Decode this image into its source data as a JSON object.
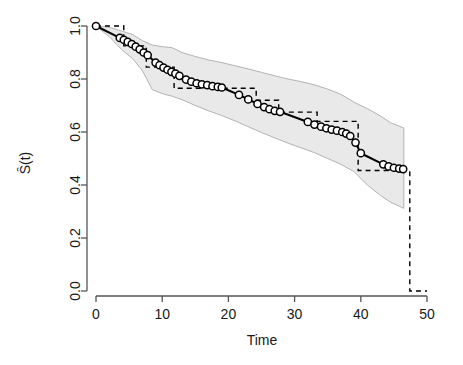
{
  "chart_data": {
    "type": "line",
    "title": "",
    "subtitle": "",
    "xlabel": "Time",
    "ylabel": "Ŝ(t)",
    "xlim": [
      -1.5,
      52
    ],
    "ylim": [
      -0.03,
      1.03
    ],
    "xticks": [
      0,
      10,
      20,
      30,
      40,
      50
    ],
    "xtick_labels": [
      "0",
      "10",
      "20",
      "30",
      "40",
      "50"
    ],
    "yticks": [
      0.0,
      0.2,
      0.4,
      0.6,
      0.8,
      1.0
    ],
    "ytick_labels": [
      "0.0",
      "0.2",
      "0.4",
      "0.6",
      "0.8",
      "1.0"
    ],
    "grid": false,
    "legend": null,
    "legend_position": "none",
    "colors": {
      "band_fill": "#e9e9e9",
      "band_stroke": "#b3b3b3",
      "smooth_line": "#000000",
      "step_line": "#000000",
      "axis": "#555555",
      "marker_face": "#ffffff",
      "marker_edge": "#000000"
    },
    "series": [
      {
        "name": "smooth-survival-estimate",
        "style": "solid-line-with-open-circles",
        "x": [
          0.0,
          3.6,
          4.2,
          4.8,
          5.4,
          6.0,
          6.6,
          7.2,
          7.8,
          9.0,
          9.6,
          10.2,
          10.8,
          11.4,
          12.0,
          12.6,
          13.6,
          14.4,
          15.2,
          16.0,
          16.8,
          17.6,
          18.4,
          19.0,
          21.6,
          23.0,
          24.4,
          25.4,
          26.2,
          27.0,
          27.8,
          32.0,
          33.0,
          34.0,
          34.8,
          35.6,
          36.4,
          37.2,
          37.8,
          38.4,
          39.2,
          40.0,
          43.4,
          44.2,
          45.0,
          45.8,
          46.4
        ],
        "y": [
          1.0,
          0.955,
          0.948,
          0.94,
          0.932,
          0.922,
          0.912,
          0.9,
          0.89,
          0.862,
          0.852,
          0.843,
          0.835,
          0.827,
          0.82,
          0.812,
          0.798,
          0.79,
          0.784,
          0.78,
          0.777,
          0.773,
          0.77,
          0.768,
          0.74,
          0.723,
          0.706,
          0.694,
          0.686,
          0.68,
          0.676,
          0.638,
          0.628,
          0.62,
          0.614,
          0.609,
          0.605,
          0.6,
          0.594,
          0.585,
          0.56,
          0.52,
          0.478,
          0.47,
          0.465,
          0.462,
          0.46
        ]
      },
      {
        "name": "kaplan-meier-step-estimate",
        "style": "dashed-step-line",
        "x": [
          0.0,
          4.2,
          4.2,
          7.6,
          7.6,
          11.8,
          11.8,
          24.2,
          24.2,
          27.6,
          27.6,
          33.4,
          33.4,
          39.6,
          39.6,
          47.4,
          47.4,
          50.0
        ],
        "y": [
          1.0,
          1.0,
          0.925,
          0.925,
          0.845,
          0.845,
          0.765,
          0.765,
          0.72,
          0.72,
          0.675,
          0.675,
          0.64,
          0.64,
          0.455,
          0.455,
          0.0,
          0.0
        ]
      }
    ],
    "confidence_band": {
      "name": "pointwise-confidence-band",
      "x": [
        0.0,
        2.0,
        4.0,
        5.5,
        7.0,
        8.5,
        10.0,
        11.5,
        13.0,
        15.0,
        17.0,
        19.0,
        21.0,
        23.0,
        25.0,
        27.0,
        29.0,
        31.0,
        33.0,
        35.0,
        37.0,
        39.0,
        41.0,
        43.0,
        44.5,
        46.5
      ],
      "upper": [
        1.0,
        0.995,
        0.98,
        0.968,
        0.945,
        0.928,
        0.922,
        0.918,
        0.9,
        0.885,
        0.872,
        0.862,
        0.85,
        0.838,
        0.825,
        0.812,
        0.8,
        0.79,
        0.778,
        0.762,
        0.742,
        0.712,
        0.688,
        0.66,
        0.635,
        0.615
      ],
      "lower": [
        1.0,
        0.96,
        0.908,
        0.878,
        0.832,
        0.76,
        0.745,
        0.735,
        0.722,
        0.7,
        0.68,
        0.662,
        0.642,
        0.62,
        0.598,
        0.578,
        0.558,
        0.54,
        0.522,
        0.5,
        0.478,
        0.45,
        0.4,
        0.36,
        0.335,
        0.312
      ]
    }
  }
}
